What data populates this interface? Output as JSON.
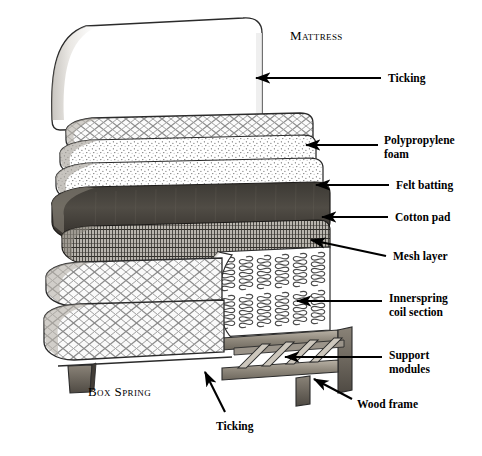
{
  "figure": {
    "background_color": "#ffffff",
    "ink_color": "#000000",
    "width": 482,
    "height": 456
  },
  "section_labels": [
    {
      "id": "mattress",
      "text": "Mattress",
      "x": 290,
      "y": 28
    },
    {
      "id": "box-spring",
      "text": "Box Spring",
      "x": 88,
      "y": 384
    }
  ],
  "callouts": [
    {
      "id": "ticking-top",
      "text": "Ticking",
      "label_x": 388,
      "label_y": 72,
      "leader": {
        "x1": 381,
        "y1": 78,
        "x2": 256,
        "y2": 78
      },
      "arrow_dir": "left"
    },
    {
      "id": "polypropylene-foam",
      "text": "Polypropylene\nfoam",
      "label_x": 384,
      "label_y": 134,
      "leader": {
        "x1": 378,
        "y1": 145,
        "x2": 306,
        "y2": 145
      },
      "arrow_dir": "left"
    },
    {
      "id": "felt-batting",
      "text": "Felt batting",
      "label_x": 396,
      "label_y": 179,
      "leader": {
        "x1": 389,
        "y1": 185,
        "x2": 316,
        "y2": 185
      },
      "arrow_dir": "left"
    },
    {
      "id": "cotton-pad",
      "text": "Cotton pad",
      "label_x": 395,
      "label_y": 211,
      "leader": {
        "x1": 388,
        "y1": 217,
        "x2": 322,
        "y2": 217
      },
      "arrow_dir": "left"
    },
    {
      "id": "mesh-layer",
      "text": "Mesh layer",
      "label_x": 393,
      "label_y": 250,
      "leader": {
        "x1": 386,
        "y1": 256,
        "x2": 311,
        "y2": 240
      },
      "arrow_dir": "left"
    },
    {
      "id": "innerspring-coil-section",
      "text": "Innerspring\ncoil section",
      "label_x": 389,
      "label_y": 292,
      "leader": {
        "x1": 382,
        "y1": 301,
        "x2": 297,
        "y2": 301
      },
      "arrow_dir": "left"
    },
    {
      "id": "support-modules",
      "text": "Support\nmodules",
      "label_x": 389,
      "label_y": 349,
      "leader": {
        "x1": 382,
        "y1": 357,
        "x2": 285,
        "y2": 357
      },
      "arrow_dir": "left"
    },
    {
      "id": "wood-frame",
      "text": "Wood frame",
      "label_x": 357,
      "label_y": 398,
      "leader": {
        "x1": 352,
        "y1": 399,
        "x2": 314,
        "y2": 379
      },
      "arrow_dir": "left"
    },
    {
      "id": "ticking-bottom",
      "text": "Ticking",
      "label_x": 216,
      "label_y": 420,
      "leader": {
        "x1": 225,
        "y1": 412,
        "x2": 205,
        "y2": 372
      },
      "arrow_dir": "up"
    }
  ],
  "layers": [
    {
      "id": "ticking-cover",
      "name": "Ticking",
      "texture": "plain"
    },
    {
      "id": "quilt-band",
      "name": "Quilted ticking band",
      "texture": "lattice"
    },
    {
      "id": "polypropylene-foam",
      "name": "Polypropylene foam",
      "texture": "stipple"
    },
    {
      "id": "felt-batting",
      "name": "Felt batting",
      "texture": "stipple"
    },
    {
      "id": "cotton-pad",
      "name": "Cotton pad",
      "texture": "dark"
    },
    {
      "id": "mesh-layer",
      "name": "Mesh layer",
      "texture": "mesh"
    },
    {
      "id": "innerspring",
      "name": "Innerspring coil section",
      "texture": "coils"
    },
    {
      "id": "box-spring-top",
      "name": "Box spring top panel",
      "texture": "diamond"
    },
    {
      "id": "box-spring-base",
      "name": "Box spring base panel",
      "texture": "diamond"
    },
    {
      "id": "wood-frame",
      "name": "Wood frame",
      "texture": "wood"
    },
    {
      "id": "support-modules",
      "name": "Support modules",
      "texture": "wood"
    }
  ]
}
